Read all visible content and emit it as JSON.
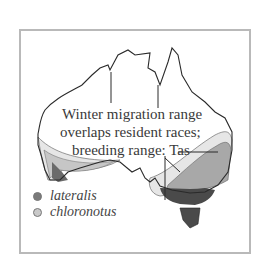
{
  "map": {
    "annotation": {
      "line1": "Winter migration range",
      "line2": "overlaps resident races;",
      "line3": "breeding range: Tas"
    },
    "legend": [
      {
        "label": "lateralis",
        "color": "#7a7a7a"
      },
      {
        "label": "chloronotus",
        "color": "#c9c9c9"
      }
    ],
    "colors": {
      "frame": "#b9b9b9",
      "outline": "#2a2a2a",
      "breeding_dark": "#4a4a4a",
      "range_mid": "#8f8f8f",
      "range_light": "#c6c6c6",
      "migration_pale": "#e6e6e6"
    }
  }
}
